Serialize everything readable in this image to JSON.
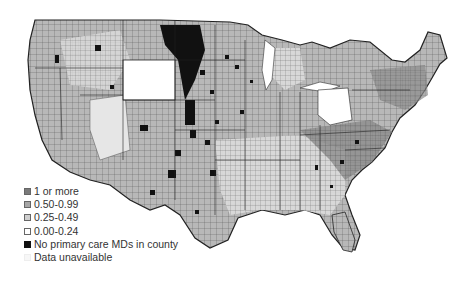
{
  "map": {
    "type": "choropleth",
    "region": "Contiguous United States (counties)",
    "colors": {
      "one_or_more": "#7a7a7a",
      "p50_99": "#a6a6a6",
      "p25_49": "#cfcfcf",
      "p00_24": "#ffffff",
      "none": "#111111",
      "unavailable": "#f7f7f7",
      "border": "#333333"
    }
  },
  "legend": {
    "items": [
      {
        "label": "1 or more",
        "color": "#7a7a7a"
      },
      {
        "label": "0.50-0.99",
        "color": "#a6a6a6"
      },
      {
        "label": "0.25-0.49",
        "color": "#cfcfcf"
      },
      {
        "label": "0.00-0.24",
        "color": "#ffffff"
      },
      {
        "label": "No primary care MDs in county",
        "color": "#111111"
      },
      {
        "label": "Data unavailable",
        "color": "#f7f7f7"
      }
    ]
  }
}
